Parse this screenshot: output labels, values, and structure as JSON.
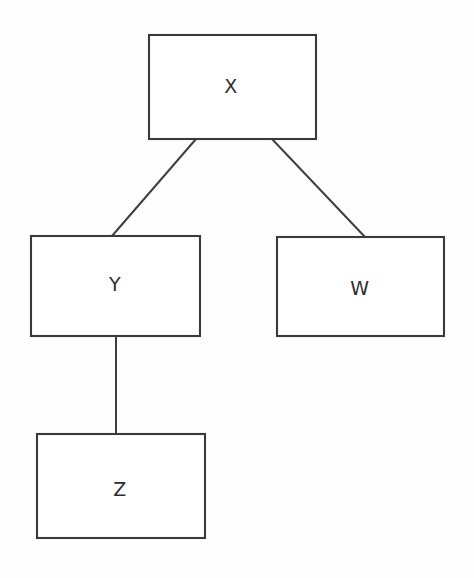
{
  "diagram": {
    "type": "tree-diagram",
    "background_color": "#fefefe",
    "stroke_color": "#3a3a3a",
    "label_color": "#2e2e2e",
    "nodes": [
      {
        "id": "x",
        "label": "X",
        "x": 149,
        "y": 35,
        "width": 167,
        "height": 104,
        "label_x": 231,
        "label_y": 86
      },
      {
        "id": "y",
        "label": "Y",
        "x": 31,
        "y": 236,
        "width": 169,
        "height": 100,
        "label_x": 115,
        "label_y": 284
      },
      {
        "id": "w",
        "label": "W",
        "x": 277,
        "y": 237,
        "width": 167,
        "height": 99,
        "label_x": 360,
        "label_y": 288
      },
      {
        "id": "z",
        "label": "Z",
        "x": 37,
        "y": 434,
        "width": 168,
        "height": 104,
        "label_x": 120,
        "label_y": 489
      }
    ],
    "edges": [
      {
        "id": "x-to-y",
        "from": "x",
        "to": "y",
        "x1": 196,
        "y1": 139,
        "x2": 112,
        "y2": 236
      },
      {
        "id": "x-to-w",
        "from": "x",
        "to": "w",
        "x1": 272,
        "y1": 139,
        "x2": 365,
        "y2": 237
      },
      {
        "id": "y-to-z",
        "from": "y",
        "to": "z",
        "x1": 116,
        "y1": 336,
        "x2": 116,
        "y2": 434
      }
    ]
  }
}
